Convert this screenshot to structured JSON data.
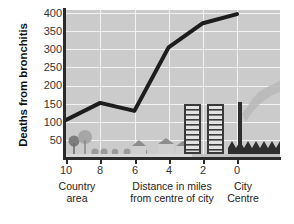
{
  "chart_data": {
    "type": "line",
    "title": "",
    "xlabel": "Distance in miles from centre of city",
    "ylabel": "Deaths from bronchitis",
    "x": [
      10,
      8,
      6,
      4,
      2,
      0
    ],
    "values": [
      105,
      152,
      130,
      305,
      372,
      397
    ],
    "series": [
      {
        "name": "Deaths from bronchitis",
        "values": [
          105,
          152,
          130,
          305,
          372,
          397
        ]
      }
    ],
    "xlim": [
      10,
      0
    ],
    "ylim": [
      0,
      400
    ],
    "x_tick_labels": [
      "10",
      "8",
      "6",
      "4",
      "2",
      "0"
    ],
    "y_tick_labels": [
      "50",
      "100",
      "150",
      "200",
      "250",
      "300",
      "350",
      "400"
    ],
    "y_ticks": [
      50,
      100,
      150,
      200,
      250,
      300,
      350,
      400
    ],
    "grid": true,
    "legend": "none",
    "x_axis_direction": "descending",
    "annotations": [
      "Country area",
      "City Centre"
    ],
    "colors": {
      "line": "#1d1d1d",
      "plot_background": "#cbcbcb",
      "gridline": "#f2f2f2",
      "axis": "#2b2b2b",
      "illustration": "#8f8f8f",
      "illustration_dark": "#2b2b2b",
      "smoke": "#b5b5b5"
    }
  },
  "axes": {
    "y_title": "Deaths from bronchitis",
    "y_ticks": [
      {
        "label": "400"
      },
      {
        "label": "350"
      },
      {
        "label": "300"
      },
      {
        "label": "250"
      },
      {
        "label": "200"
      },
      {
        "label": "150"
      },
      {
        "label": "100"
      },
      {
        "label": "50"
      }
    ],
    "x_ticks": [
      {
        "label": "10"
      },
      {
        "label": "8"
      },
      {
        "label": "6"
      },
      {
        "label": "4"
      },
      {
        "label": "2"
      },
      {
        "label": "0"
      }
    ]
  },
  "captions": {
    "left_line1": "Country",
    "left_line2": "area",
    "middle_line1": "Distance in miles",
    "middle_line2": "from centre of city",
    "right_line1": "City",
    "right_line2": "Centre"
  },
  "illustration": {
    "description": "countryside-to-city skyline silhouette along the baseline",
    "left_items": "trees-and-bushes",
    "middle_items": "houses",
    "right_items": "tower-blocks-and-factory-with-smoking-chimney"
  }
}
